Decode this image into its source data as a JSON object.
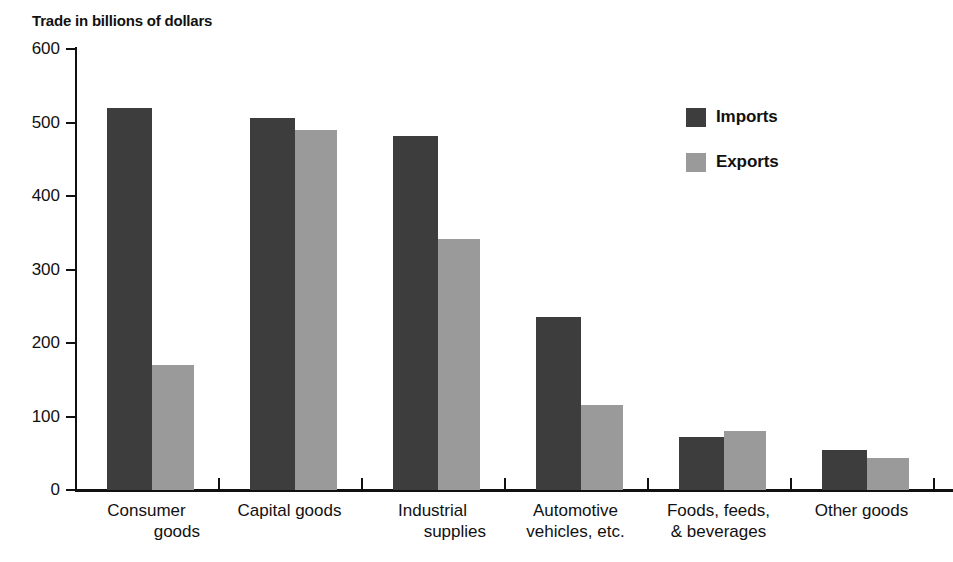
{
  "chart_data": {
    "type": "bar",
    "title": "Trade in billions of dollars",
    "xlabel": "",
    "ylabel": "",
    "ylim": [
      0,
      600
    ],
    "grid": false,
    "legend_position": "top-right",
    "categories": [
      "Consumer goods",
      "Capital goods",
      "Industrial supplies",
      "Automotive vehicles, etc.",
      "Foods, feeds, & beverages",
      "Other goods"
    ],
    "category_lines": [
      [
        "Consumer",
        "goods"
      ],
      [
        "Capital goods",
        ""
      ],
      [
        "Industrial",
        "supplies"
      ],
      [
        "Automotive",
        "vehicles, etc."
      ],
      [
        "Foods, feeds,",
        "& beverages"
      ],
      [
        "Other goods",
        ""
      ]
    ],
    "series": [
      {
        "name": "Imports",
        "color": "#3d3d3d",
        "values": [
          520,
          506,
          482,
          236,
          72,
          55
        ]
      },
      {
        "name": "Exports",
        "color": "#9a9a9a",
        "values": [
          170,
          490,
          342,
          116,
          80,
          43
        ]
      }
    ],
    "yticks": [
      0,
      100,
      200,
      300,
      400,
      500,
      600
    ],
    "ytick_labels": [
      "0",
      "100",
      "200",
      "300",
      "400",
      "500",
      "600"
    ]
  },
  "legend": {
    "items": [
      {
        "label": "Imports",
        "color": "#3d3d3d"
      },
      {
        "label": "Exports",
        "color": "#9a9a9a"
      }
    ]
  }
}
